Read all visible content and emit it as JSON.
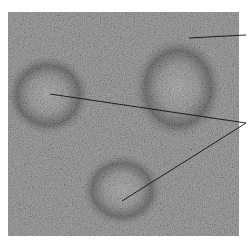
{
  "figure": {
    "image": {
      "x": 8,
      "y": 12,
      "width": 231,
      "height": 224,
      "base_color": "#8e8e8e"
    },
    "follicles": [
      {
        "cx": 48,
        "cy": 95,
        "rx": 40,
        "ry": 38
      },
      {
        "cx": 178,
        "cy": 88,
        "rx": 42,
        "ry": 48
      },
      {
        "cx": 122,
        "cy": 190,
        "rx": 38,
        "ry": 34
      }
    ],
    "leader_lines": [
      {
        "x1": 189,
        "y1": 38,
        "x2": 246,
        "y2": 35
      },
      {
        "x1": 50,
        "y1": 94,
        "x2": 246,
        "y2": 123
      },
      {
        "x1": 122,
        "y1": 201,
        "x2": 246,
        "y2": 123
      }
    ],
    "line_color": "#111111"
  }
}
